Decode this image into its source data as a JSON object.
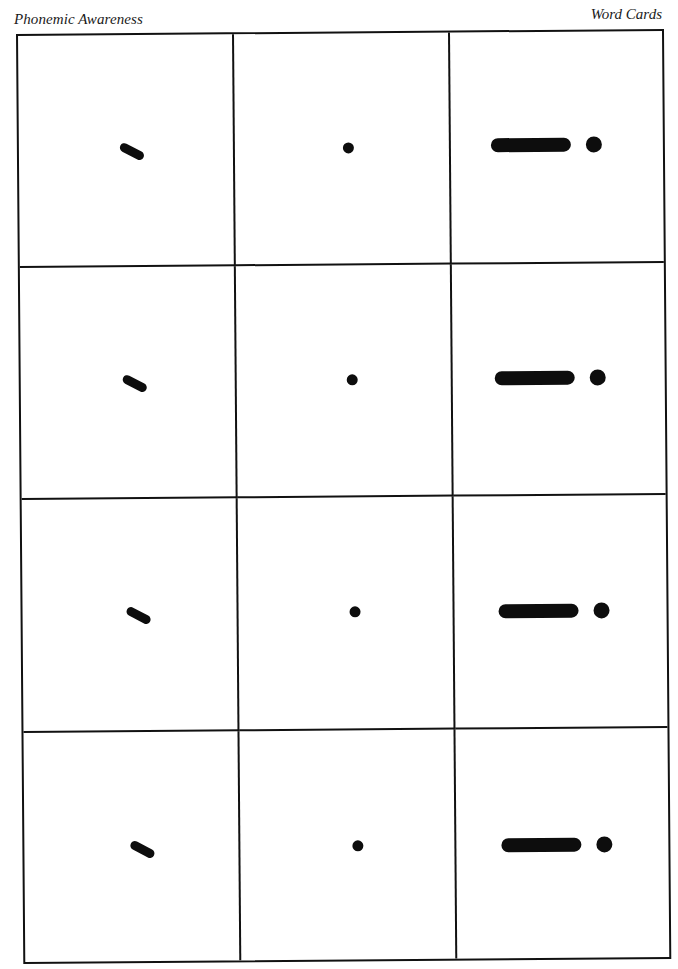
{
  "header": {
    "left_title": "Phonemic Awareness",
    "right_title": "Word Cards"
  },
  "grid": {
    "columns": 3,
    "rows": 4,
    "line_color": "#111111",
    "symbol_color": "#0d0d0d"
  },
  "cards": [
    {
      "row": 1,
      "col": 1,
      "symbol": "slanted-dash"
    },
    {
      "row": 1,
      "col": 2,
      "symbol": "small-dot"
    },
    {
      "row": 1,
      "col": 3,
      "symbol": "long-bar-and-dot"
    },
    {
      "row": 2,
      "col": 1,
      "symbol": "slanted-dash"
    },
    {
      "row": 2,
      "col": 2,
      "symbol": "small-dot"
    },
    {
      "row": 2,
      "col": 3,
      "symbol": "long-bar-and-dot"
    },
    {
      "row": 3,
      "col": 1,
      "symbol": "slanted-dash"
    },
    {
      "row": 3,
      "col": 2,
      "symbol": "small-dot"
    },
    {
      "row": 3,
      "col": 3,
      "symbol": "long-bar-and-dot"
    },
    {
      "row": 4,
      "col": 1,
      "symbol": "slanted-dash"
    },
    {
      "row": 4,
      "col": 2,
      "symbol": "small-dot"
    },
    {
      "row": 4,
      "col": 3,
      "symbol": "long-bar-and-dot"
    }
  ]
}
